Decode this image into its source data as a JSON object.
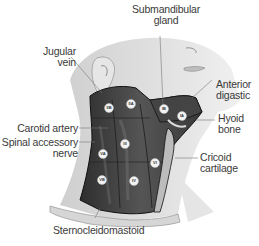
{
  "diagram": {
    "labels": {
      "submandibular_gland": [
        "Submandibular",
        "gland"
      ],
      "jugular_vein": [
        "Jugular",
        "vein"
      ],
      "anterior_digastic": [
        "Anterior",
        "digastic"
      ],
      "carotid_artery": [
        "Carotid artery"
      ],
      "hyoid_bone": [
        "Hyoid",
        "bone"
      ],
      "spinal_accessory_nerve": [
        "Spinal accessory",
        "nerve"
      ],
      "cricoid_cartilage": [
        "Cricoid",
        "cartilage"
      ],
      "sternocleidomastoid": [
        "Sternocleidomastoid"
      ]
    },
    "levels": [
      {
        "id": "IIB",
        "x": 109,
        "y": 108
      },
      {
        "id": "IIA",
        "x": 131,
        "y": 104
      },
      {
        "id": "IB",
        "x": 164,
        "y": 109
      },
      {
        "id": "IA",
        "x": 182,
        "y": 116
      },
      {
        "id": "III",
        "x": 125,
        "y": 144
      },
      {
        "id": "VA",
        "x": 103,
        "y": 154
      },
      {
        "id": "VI",
        "x": 155,
        "y": 163
      },
      {
        "id": "VB",
        "x": 102,
        "y": 180
      },
      {
        "id": "IV",
        "x": 134,
        "y": 181
      }
    ],
    "colors": {
      "skin": "#d9d9d9",
      "skin_light": "#ebebeb",
      "muscle_dark": "#3c3c3c",
      "muscle_mid": "#5a5a5a",
      "outline": "#1a1a1a",
      "text": "#3a3a3a",
      "leader": "#777777"
    }
  }
}
